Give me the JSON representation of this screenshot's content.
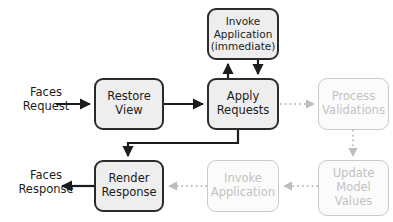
{
  "diagram": {
    "canvas": {
      "width": 393,
      "height": 222
    },
    "colors": {
      "active_border": "#2b2b2b",
      "active_fill": "#eeeeee",
      "active_text": "#1c1c1c",
      "inactive_border": "#cacaca",
      "inactive_fill": "#fbfbfb",
      "inactive_text": "#c2c2c2",
      "background": "#ffffff",
      "solid_edge": "#1c1c1c",
      "dotted_edge": "#bdbdbd"
    },
    "io_labels": [
      {
        "id": "faces-request",
        "text": "Faces\nRequest",
        "x": 14,
        "y": 85,
        "width": 64
      },
      {
        "id": "faces-response",
        "text": "Faces\nResponse",
        "x": 8,
        "y": 168,
        "width": 76
      }
    ],
    "nodes": [
      {
        "id": "invoke-application-immediate",
        "label": "Invoke\nApplication\n(immediate)",
        "state": "active",
        "x": 207,
        "y": 8,
        "width": 72,
        "height": 52,
        "font": "small"
      },
      {
        "id": "restore-view",
        "label": "Restore\nView",
        "state": "active",
        "x": 94,
        "y": 78,
        "width": 70,
        "height": 52,
        "font": "normal"
      },
      {
        "id": "apply-requests",
        "label": "Apply\nRequests",
        "state": "active",
        "x": 207,
        "y": 78,
        "width": 72,
        "height": 52,
        "font": "normal"
      },
      {
        "id": "process-validations",
        "label": "Process\nValidations",
        "state": "inactive",
        "x": 318,
        "y": 78,
        "width": 71,
        "height": 52,
        "font": "normal"
      },
      {
        "id": "render-response",
        "label": "Render\nResponse",
        "state": "active",
        "x": 94,
        "y": 160,
        "width": 70,
        "height": 52,
        "font": "normal"
      },
      {
        "id": "invoke-application",
        "label": "Invoke\nApplication",
        "state": "inactive",
        "x": 207,
        "y": 160,
        "width": 72,
        "height": 52,
        "font": "normal"
      },
      {
        "id": "update-model-values",
        "label": "Update\nModel\nValues",
        "state": "inactive",
        "x": 318,
        "y": 160,
        "width": 71,
        "height": 56,
        "font": "normal"
      }
    ],
    "edges": [
      {
        "id": "edge-request-to-restore-view",
        "from": "faces-request",
        "to": "restore-view",
        "style": "solid"
      },
      {
        "id": "edge-restore-view-to-apply-requests",
        "from": "restore-view",
        "to": "apply-requests",
        "style": "solid"
      },
      {
        "id": "edge-apply-requests-to-invoke-immediate",
        "from": "apply-requests",
        "to": "invoke-application-immediate",
        "style": "solid"
      },
      {
        "id": "edge-invoke-immediate-to-apply-requests",
        "from": "invoke-application-immediate",
        "to": "apply-requests",
        "style": "solid"
      },
      {
        "id": "edge-apply-requests-to-process-validations",
        "from": "apply-requests",
        "to": "process-validations",
        "style": "dotted"
      },
      {
        "id": "edge-process-validations-to-update-model-values",
        "from": "process-validations",
        "to": "update-model-values",
        "style": "dotted"
      },
      {
        "id": "edge-update-model-values-to-invoke-application",
        "from": "update-model-values",
        "to": "invoke-application",
        "style": "dotted"
      },
      {
        "id": "edge-invoke-application-to-render-response",
        "from": "invoke-application",
        "to": "render-response",
        "style": "dotted"
      },
      {
        "id": "edge-apply-requests-to-render-response",
        "from": "apply-requests",
        "to": "render-response",
        "style": "solid"
      },
      {
        "id": "edge-render-response-to-faces-response",
        "from": "render-response",
        "to": "faces-response",
        "style": "solid"
      }
    ]
  }
}
